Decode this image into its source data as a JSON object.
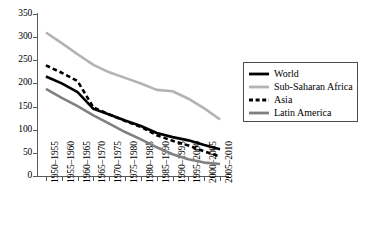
{
  "chart_data": {
    "type": "line",
    "title": "",
    "subtitle": "",
    "xlabel": "",
    "ylabel": "",
    "ylim": [
      0,
      350
    ],
    "yticks": [
      0,
      50,
      100,
      150,
      200,
      250,
      300,
      350
    ],
    "grid": false,
    "legend_position": "right",
    "categories": [
      "1950–1955",
      "1955–1960",
      "1960–1965",
      "1965–1970",
      "1970–1975",
      "1975–1980",
      "1980–1985",
      "1985–1990",
      "1990–1995",
      "1995–2000",
      "2000–2005",
      "2005–2010"
    ],
    "series": [
      {
        "name": "World",
        "color": "#000000",
        "style": "solid",
        "width": 2.6,
        "values": [
          215,
          200,
          181,
          145,
          133,
          120,
          108,
          93,
          84,
          77,
          67,
          58
        ]
      },
      {
        "name": "Sub-Saharan Africa",
        "color": "#b3b3b3",
        "style": "solid",
        "width": 2.6,
        "values": [
          310,
          287,
          263,
          240,
          224,
          212,
          200,
          186,
          183,
          167,
          146,
          122
        ]
      },
      {
        "name": "Asia",
        "color": "#000000",
        "style": "dashed",
        "width": 2.6,
        "values": [
          239,
          223,
          205,
          148,
          133,
          119,
          106,
          88,
          76,
          66,
          53,
          42
        ]
      },
      {
        "name": "Latin America",
        "color": "#808080",
        "style": "solid",
        "width": 2.6,
        "values": [
          188,
          169,
          151,
          131,
          113,
          95,
          79,
          62,
          47,
          36,
          29,
          26
        ]
      }
    ]
  },
  "legend": {
    "entries": [
      {
        "label": "World",
        "icon": "solid-black-line-swatch"
      },
      {
        "label": "Sub-Saharan Africa",
        "icon": "solid-lightgray-line-swatch"
      },
      {
        "label": "Asia",
        "icon": "dashed-black-line-swatch"
      },
      {
        "label": "Latin America",
        "icon": "solid-gray-line-swatch"
      }
    ]
  }
}
